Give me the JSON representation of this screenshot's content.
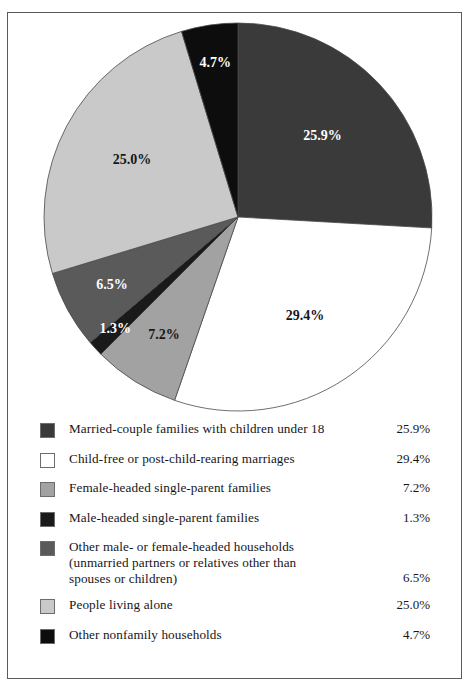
{
  "chart_data": {
    "type": "pie",
    "title": "",
    "subtitle": "",
    "legend_position": "bottom",
    "start_angle_deg": 0,
    "direction": "clockwise",
    "categories": [
      "Married-couple families with children under 18",
      "Child-free or post-child-rearing marriages",
      "Female-headed single-parent families",
      "Male-headed single-parent families",
      "Other male- or female-headed households (unmarried partners or relatives other than spouses or children)",
      "People living alone",
      "Other nonfamily households"
    ],
    "values": [
      25.9,
      29.4,
      7.2,
      1.3,
      6.5,
      25.0,
      4.7
    ],
    "value_labels": [
      "25.9%",
      "29.4%",
      "7.2%",
      "1.3%",
      "6.5%",
      "25.0%",
      "4.7%"
    ],
    "colors": [
      "#3a3a3a",
      "#ffffff",
      "#a2a2a2",
      "#1a1a1a",
      "#5a5a5a",
      "#c9c9c9",
      "#0d0d0d"
    ],
    "label_colors": [
      "#ffffff",
      "#16161a",
      "#16161a",
      "#ffffff",
      "#ffffff",
      "#16161a",
      "#ffffff"
    ],
    "unit": "%"
  },
  "pie": {
    "slices": [
      {
        "label": "25.9%",
        "value": 25.9,
        "color": "#3a3a3a",
        "text_color": "#ffffff"
      },
      {
        "label": "29.4%",
        "value": 29.4,
        "color": "#ffffff",
        "text_color": "#16161a"
      },
      {
        "label": "7.2%",
        "value": 7.2,
        "color": "#a2a2a2",
        "text_color": "#16161a"
      },
      {
        "label": "1.3%",
        "value": 1.3,
        "color": "#1a1a1a",
        "text_color": "#ffffff"
      },
      {
        "label": "6.5%",
        "value": 6.5,
        "color": "#5a5a5a",
        "text_color": "#ffffff"
      },
      {
        "label": "25.0%",
        "value": 25.0,
        "color": "#c9c9c9",
        "text_color": "#16161a"
      },
      {
        "label": "4.7%",
        "value": 4.7,
        "color": "#0d0d0d",
        "text_color": "#ffffff"
      }
    ]
  },
  "legend": {
    "items": [
      {
        "swatch": "#3a3a3a",
        "line1": "Married-couple families with children under 18",
        "line2": "",
        "line3": "",
        "pct": "25.9%"
      },
      {
        "swatch": "#ffffff",
        "line1": "Child-free or post-child-rearing marriages",
        "line2": "",
        "line3": "",
        "pct": "29.4%"
      },
      {
        "swatch": "#a2a2a2",
        "line1": "Female-headed single-parent families",
        "line2": "",
        "line3": "",
        "pct": "7.2%"
      },
      {
        "swatch": "#1a1a1a",
        "line1": "Male-headed single-parent families",
        "line2": "",
        "line3": "",
        "pct": "1.3%"
      },
      {
        "swatch": "#5a5a5a",
        "line1": "Other male- or female-headed households",
        "line2": "(unmarried partners or relatives other than",
        "line3": "spouses or children)",
        "pct": "6.5%"
      },
      {
        "swatch": "#c9c9c9",
        "line1": "People living alone",
        "line2": "",
        "line3": "",
        "pct": "25.0%"
      },
      {
        "swatch": "#0d0d0d",
        "line1": "Other nonfamily households",
        "line2": "",
        "line3": "",
        "pct": "4.7%"
      }
    ]
  }
}
